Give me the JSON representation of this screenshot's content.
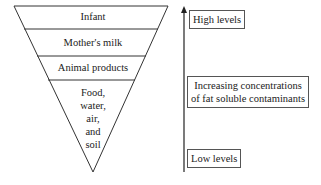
{
  "pyramid": {
    "levels": [
      {
        "label": "Infant"
      },
      {
        "label": "Mother's milk"
      },
      {
        "label": "Animal products"
      },
      {
        "label_lines": [
          "Food,",
          "water,",
          "air,",
          "and",
          "soil"
        ]
      }
    ]
  },
  "scale": {
    "top_label": "High levels",
    "middle_label_lines": [
      "Increasing concentrations",
      "of fat soluble contaminants"
    ],
    "bottom_label": "Low levels"
  },
  "colors": {
    "line": "#333333",
    "background": "#ffffff"
  }
}
